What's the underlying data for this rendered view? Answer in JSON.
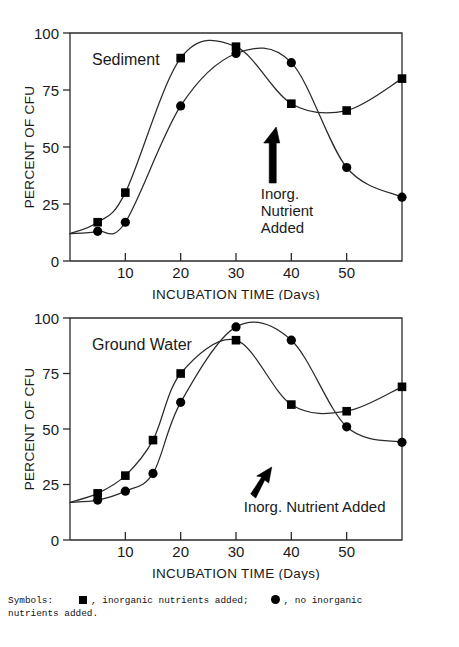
{
  "figure": {
    "caption": {
      "prefix": "Symbols:",
      "square_desc": ", inorganic nutrients added;",
      "circle_desc": ", no inorganic",
      "line2": "nutrients added.",
      "square_symbol": "filled-square",
      "circle_symbol": "filled-circle"
    }
  },
  "chart_data": [
    {
      "type": "line",
      "title": "Sediment",
      "panel_id": "sediment",
      "xlabel": "INCUBATION TIME (Days)",
      "ylabel": "PERCENT OF CFU",
      "xlim": [
        0,
        60
      ],
      "ylim": [
        0,
        100
      ],
      "xticks": [
        10,
        20,
        30,
        40,
        50
      ],
      "xtick_labels": [
        "10",
        "20",
        "30",
        "40",
        "50"
      ],
      "yticks": [
        0,
        25,
        50,
        75,
        100
      ],
      "ytick_labels": [
        "0",
        "25",
        "50",
        "75",
        "100"
      ],
      "grid": false,
      "legend": "none",
      "annotations": [
        {
          "text_lines": [
            "Inorg.",
            "Nutrient",
            "Added"
          ],
          "arrow": "up-arrow",
          "x_day": 37
        }
      ],
      "series": [
        {
          "name": "inorganic nutrients added",
          "marker": "filled-square",
          "x": [
            5,
            10,
            20,
            30,
            40,
            50,
            60
          ],
          "values": [
            17,
            30,
            89,
            94,
            69,
            66,
            80
          ]
        },
        {
          "name": "no inorganic nutrients added",
          "marker": "filled-circle",
          "x": [
            5,
            10,
            20,
            30,
            40,
            50,
            60
          ],
          "values": [
            13,
            17,
            68,
            91,
            87,
            41,
            28
          ]
        }
      ]
    },
    {
      "type": "line",
      "title": "Ground Water",
      "panel_id": "groundwater",
      "xlabel": "INCUBATION TIME (Days)",
      "ylabel": "PERCENT OF CFU",
      "xlim": [
        0,
        60
      ],
      "ylim": [
        0,
        100
      ],
      "xticks": [
        10,
        20,
        30,
        40,
        50
      ],
      "xtick_labels": [
        "10",
        "20",
        "30",
        "40",
        "50"
      ],
      "yticks": [
        0,
        25,
        50,
        75,
        100
      ],
      "ytick_labels": [
        "0",
        "25",
        "50",
        "75",
        "100"
      ],
      "grid": false,
      "legend": "none",
      "annotations": [
        {
          "text_lines": [
            "Inorg. Nutrient Added"
          ],
          "arrow": "up-right-arrow",
          "x_day": 37
        }
      ],
      "series": [
        {
          "name": "inorganic nutrients added",
          "marker": "filled-square",
          "x": [
            5,
            10,
            15,
            20,
            30,
            40,
            50,
            60
          ],
          "values": [
            21,
            29,
            45,
            75,
            90,
            61,
            58,
            69
          ]
        },
        {
          "name": "no inorganic nutrients added",
          "marker": "filled-circle",
          "x": [
            5,
            10,
            15,
            20,
            30,
            40,
            50,
            60
          ],
          "values": [
            18,
            22,
            30,
            62,
            96,
            90,
            51,
            44
          ]
        }
      ]
    }
  ]
}
